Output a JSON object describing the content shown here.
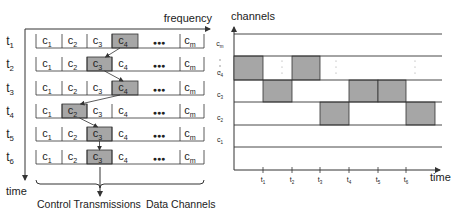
{
  "left_panel": {
    "x_axis_label": "frequency",
    "y_axis_label": "time",
    "row_labels": [
      {
        "base": "t",
        "sub": "1"
      },
      {
        "base": "t",
        "sub": "2"
      },
      {
        "base": "t",
        "sub": "3"
      },
      {
        "base": "t",
        "sub": "4"
      },
      {
        "base": "t",
        "sub": "5"
      },
      {
        "base": "t",
        "sub": "6"
      }
    ],
    "cells": [
      {
        "base": "c",
        "sub": "1"
      },
      {
        "base": "c",
        "sub": "2"
      },
      {
        "base": "c",
        "sub": "3"
      },
      {
        "base": "c",
        "sub": "4"
      },
      {
        "base": "",
        "sub": "",
        "ellipsis": "●●●"
      },
      {
        "base": "c",
        "sub": "m"
      }
    ],
    "highlighted_cell_per_row": [
      4,
      3,
      4,
      2,
      3,
      3
    ],
    "brace_labels": {
      "control": "Control Transmissions",
      "data": "Data Channels"
    }
  },
  "right_panel": {
    "y_axis_label": "channels",
    "x_axis_label": "time",
    "channel_labels": [
      {
        "base": "c",
        "sub": "m"
      },
      {
        "base": "⋮",
        "sub": ""
      },
      {
        "base": "c",
        "sub": "4"
      },
      {
        "base": "c",
        "sub": "3"
      },
      {
        "base": "c",
        "sub": "2"
      },
      {
        "base": "c",
        "sub": "1"
      }
    ],
    "time_ticks": [
      {
        "base": "t",
        "sub": "1"
      },
      {
        "base": "t",
        "sub": "2"
      },
      {
        "base": "t",
        "sub": "3"
      },
      {
        "base": "t",
        "sub": "4"
      },
      {
        "base": "t",
        "sub": "5"
      },
      {
        "base": "t",
        "sub": "6"
      }
    ],
    "occupied_slots": [
      {
        "channel": "c4",
        "slot": 0
      },
      {
        "channel": "c3",
        "slot": 1
      },
      {
        "channel": "c4",
        "slot": 2
      },
      {
        "channel": "c2",
        "slot": 3
      },
      {
        "channel": "c3",
        "slot": 4
      },
      {
        "channel": "c3",
        "slot": 5
      },
      {
        "channel": "c2",
        "slot": 6
      }
    ]
  },
  "colors": {
    "highlight_fill": "#a6a6a6",
    "line": "#333333",
    "text": "#222222"
  }
}
